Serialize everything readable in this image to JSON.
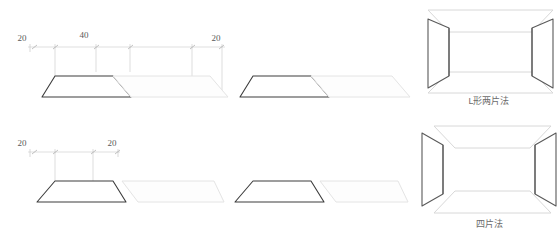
{
  "figure": {
    "title": "",
    "background_color": "#ffffff",
    "width": 559,
    "height": 244
  },
  "colors": {
    "dark_outline": "#3c3c3c",
    "light_outline": "#e2e2e2",
    "medium_outline": "#cfcfcf",
    "dimension_line": "#bcbcbc",
    "extension_line": "#c8c8c8",
    "dim_text": "#5a5a5a",
    "label_text": "#6b6b6b",
    "box_edge": "#444444",
    "box_face": "#dcdcdc"
  },
  "rows": [
    {
      "name": "l-shape-two-piece",
      "label": "L形两片法",
      "dimensions": [
        {
          "value": "20",
          "x": 22,
          "y": 41
        },
        {
          "value": "40",
          "x": 84,
          "y": 38
        },
        {
          "value": "20",
          "x": 216,
          "y": 41
        }
      ],
      "dimension_ticks": [
        {
          "x": 34,
          "y": 47
        },
        {
          "x": 55,
          "y": 47
        },
        {
          "x": 96,
          "y": 47
        },
        {
          "x": 130,
          "y": 47
        },
        {
          "x": 192,
          "y": 47
        },
        {
          "x": 219,
          "y": 47
        }
      ],
      "groups": [
        {
          "name": "group-left",
          "pieces": [
            {
              "type": "trapezoid-dark",
              "shade": "dark"
            },
            {
              "type": "parallelogram-light",
              "shade": "light"
            }
          ]
        },
        {
          "name": "group-right",
          "pieces": [
            {
              "type": "trapezoid-dark",
              "shade": "dark"
            },
            {
              "type": "parallelogram-light",
              "shade": "light"
            }
          ]
        }
      ],
      "assembly": {
        "name": "box-assembly-two-piece",
        "panels": [
          "top-panel",
          "bottom-panel",
          "left-panel",
          "right-panel"
        ],
        "gap_style": "joined"
      }
    },
    {
      "name": "four-piece",
      "label": "四片法",
      "dimensions": [
        {
          "value": "20",
          "x": 22,
          "y": 146
        },
        {
          "value": "20",
          "x": 112,
          "y": 146
        }
      ],
      "dimension_ticks": [
        {
          "x": 34,
          "y": 152
        },
        {
          "x": 55,
          "y": 152
        },
        {
          "x": 93,
          "y": 152
        },
        {
          "x": 115,
          "y": 152
        }
      ],
      "groups": [
        {
          "name": "group-left",
          "pieces": [
            {
              "type": "trapezoid-dark",
              "shade": "dark"
            },
            {
              "type": "parallelogram-light",
              "shade": "light"
            }
          ]
        },
        {
          "name": "group-right",
          "pieces": [
            {
              "type": "trapezoid-dark",
              "shade": "dark"
            },
            {
              "type": "parallelogram-light",
              "shade": "light"
            }
          ]
        }
      ],
      "assembly": {
        "name": "box-assembly-four-piece",
        "panels": [
          "top-panel",
          "bottom-panel",
          "left-panel",
          "right-panel"
        ],
        "gap_style": "separated"
      }
    }
  ]
}
